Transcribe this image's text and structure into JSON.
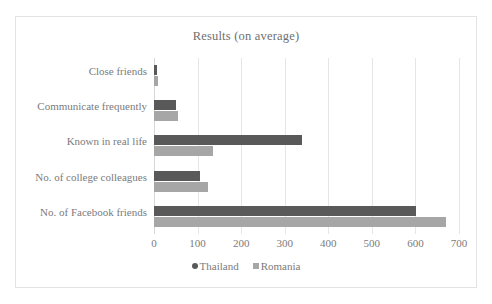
{
  "chart_data": {
    "type": "bar",
    "orientation": "horizontal",
    "title": "Results (on average)",
    "xlabel": "",
    "ylabel": "",
    "xlim": [
      0,
      700
    ],
    "xticks": [
      0,
      100,
      200,
      300,
      400,
      500,
      600,
      700
    ],
    "xtick_labels": [
      "0",
      "100",
      "200",
      "300",
      "400",
      "500",
      "600",
      "700"
    ],
    "grid": true,
    "grid_axis": "x",
    "legend_position": "bottom",
    "categories": [
      "Close friends",
      "Communicate frequently",
      "Known in real life",
      "No. of college colleagues",
      "No. of Facebook friends"
    ],
    "series": [
      {
        "name": "Thailand",
        "marker": "circle-marker",
        "color": "#595959",
        "values": [
          8,
          50,
          339,
          106,
          602
        ]
      },
      {
        "name": "Romania",
        "marker": "square-marker",
        "color": "#a6a6a6",
        "values": [
          9,
          54,
          136,
          123,
          671
        ]
      }
    ]
  },
  "colors": {
    "thailand": "#595959",
    "romania": "#a6a6a6",
    "gridline": "#e6e6e6",
    "border": "#e3e3e3",
    "text": "#7b7b7b",
    "background": "#ffffff"
  }
}
